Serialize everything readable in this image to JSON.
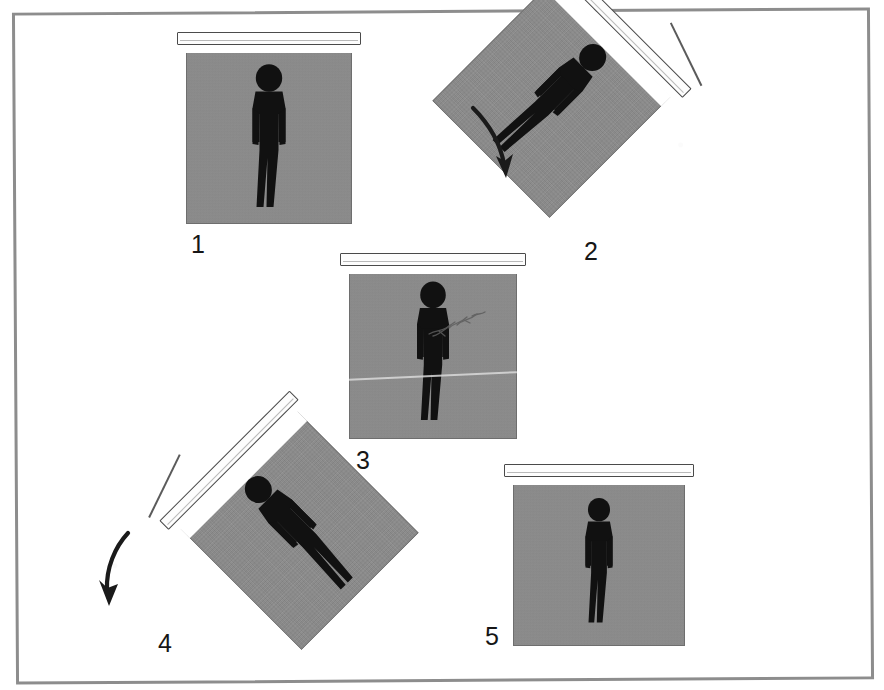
{
  "figure": {
    "background_color": "#ffffff",
    "frame_color": "#8d8d8d",
    "poster_color": "#8c8c8c",
    "poster_outline_color": "#6e6e6e",
    "bar_fill_color": "#fdfdfd",
    "bar_outline_color": "#4a4a4a",
    "figure_color": "#111111",
    "caption_color": "#161616",
    "arrow_color": "#1a1a1a"
  },
  "panels": [
    {
      "id": "panel-1",
      "caption": "1",
      "rotation_deg": 0,
      "state": "upright",
      "has_arrow": false,
      "arrow_direction": "",
      "has_damage": false
    },
    {
      "id": "panel-2",
      "caption": "2",
      "rotation_deg": 45,
      "state": "tilted-clockwise",
      "has_arrow": true,
      "arrow_direction": "clockwise-down",
      "has_damage": false
    },
    {
      "id": "panel-3",
      "caption": "3",
      "rotation_deg": 0,
      "state": "upright",
      "has_arrow": false,
      "arrow_direction": "",
      "has_damage": true
    },
    {
      "id": "panel-4",
      "caption": "4",
      "rotation_deg": -45,
      "state": "tilted-counterclockwise",
      "has_arrow": true,
      "arrow_direction": "counterclockwise-down",
      "has_damage": false
    },
    {
      "id": "panel-5",
      "caption": "5",
      "rotation_deg": 0,
      "state": "upright",
      "has_arrow": false,
      "arrow_direction": "",
      "has_damage": false
    }
  ],
  "icons": {
    "person": "standing-person-pictogram",
    "rotation_arrow": "curved-rotation-arrow",
    "hanging_bar": "poster-hanging-rail"
  }
}
